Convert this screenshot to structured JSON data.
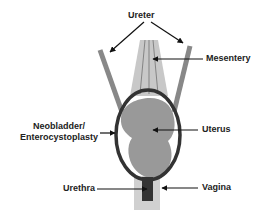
{
  "diagram": {
    "labels": {
      "ureter": "Ureter",
      "mesentery": "Mesentery",
      "neobladder_line1": "Neobladder/",
      "neobladder_line2": "Enterocystoplasty",
      "uterus": "Uterus",
      "urethra": "Urethra",
      "vagina": "Vagina"
    },
    "colors": {
      "ureter": "#888888",
      "mesentery": "#c8c8c8",
      "mesentery_lines": "#555555",
      "neobladder_ring": "#333333",
      "uterus": "#999999",
      "vagina": "#d0d0d0",
      "urethra": "#333333",
      "arrow": "#111111",
      "text": "#222222"
    }
  }
}
